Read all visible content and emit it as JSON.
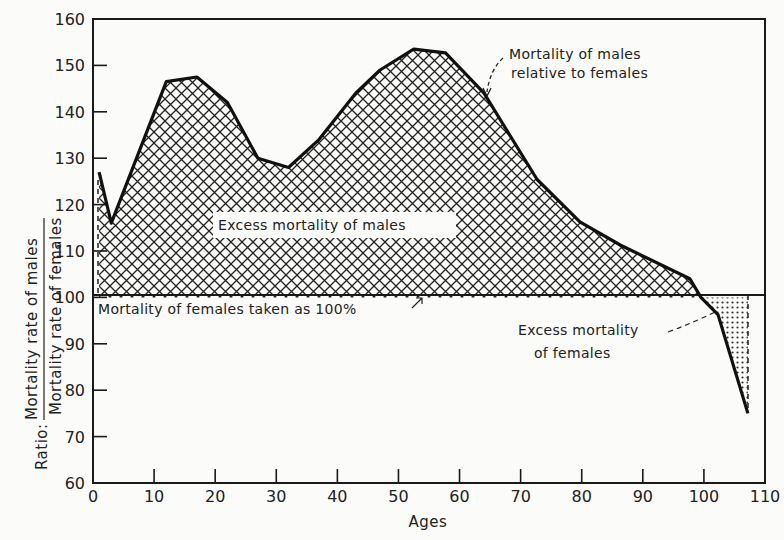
{
  "chart_data": {
    "type": "area",
    "title": "",
    "xlabel": "Ages",
    "ylabel": "Ratio: Mortality rate of males / Mortality rate of females",
    "ylabel_prefix": "Ratio:",
    "ylabel_numerator": "Mortality rate of males",
    "ylabel_denominator": "Mortality rate of females",
    "xlim": [
      0,
      110
    ],
    "ylim": [
      60,
      160
    ],
    "xticks": [
      0,
      10,
      20,
      30,
      40,
      50,
      60,
      70,
      80,
      90,
      100,
      110
    ],
    "yticks": [
      60,
      70,
      80,
      90,
      100,
      110,
      120,
      130,
      140,
      150,
      160
    ],
    "baseline": 100,
    "grid": false,
    "series": [
      {
        "name": "Mortality of males relative to females",
        "x": [
          1,
          3,
          8,
          12,
          17,
          22,
          27,
          32,
          37,
          43,
          47,
          52.5,
          57.7,
          64,
          72.7,
          79.7,
          86.3,
          97.7,
          99.5,
          102.3,
          107.2
        ],
        "values": [
          127,
          116,
          133,
          146.5,
          147.5,
          142,
          130,
          128,
          134,
          144,
          149,
          153.5,
          152.7,
          144,
          125.4,
          116.3,
          111.3,
          104,
          100,
          96.3,
          75
        ]
      }
    ],
    "annotations": [
      {
        "text": "Mortality of males relative to females",
        "target": "curve"
      },
      {
        "text": "Excess mortality of males",
        "region": "above 100 (cross-hatched)"
      },
      {
        "text": "Mortality of females taken as 100%",
        "target": "baseline 100"
      },
      {
        "text": "Excess mortality of females",
        "region": "below 100 (dotted)"
      }
    ]
  },
  "labels": {
    "annotation_males_line1": "Mortality of males",
    "annotation_males_line2": "relative to females",
    "excess_males": "Excess mortality of males",
    "baseline_note": "Mortality of females taken as 100%",
    "excess_females_line1": "Excess mortality",
    "excess_females_line2": "of females",
    "xlabel": "Ages",
    "ylabel_prefix": "Ratio:",
    "ylabel_numerator": "Mortality rate of males",
    "ylabel_denominator": "Mortality rate of females"
  },
  "colors": {
    "ink": "#1a1a1a",
    "background": "#fbfbf9"
  }
}
